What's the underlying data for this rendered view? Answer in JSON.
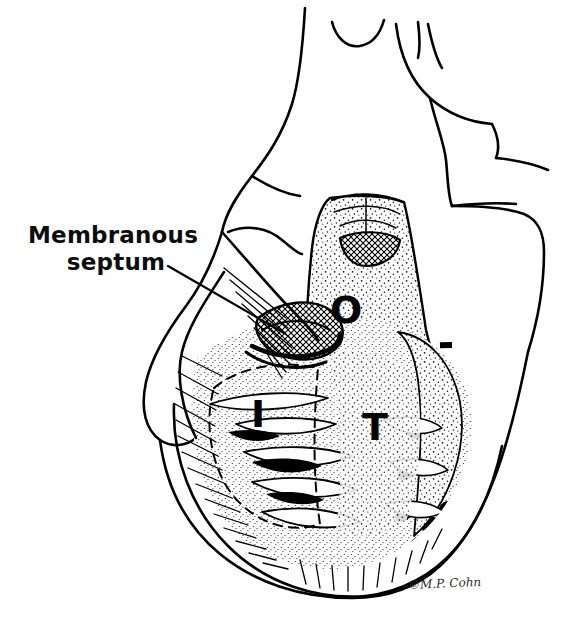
{
  "figure": {
    "medium": "pen-and-ink line drawing",
    "background_color": "#ffffff",
    "ink_color": "#000000"
  },
  "labels": {
    "membranous_septum": {
      "line1": "Membranous",
      "line2": "septum",
      "has_leader_line": true
    }
  },
  "zone_markers": [
    {
      "id": "outlet",
      "letter": "O"
    },
    {
      "id": "inlet",
      "letter": "I"
    },
    {
      "id": "trabecular",
      "letter": "T"
    }
  ],
  "credit": {
    "signature": "©M.P. Cohn"
  }
}
